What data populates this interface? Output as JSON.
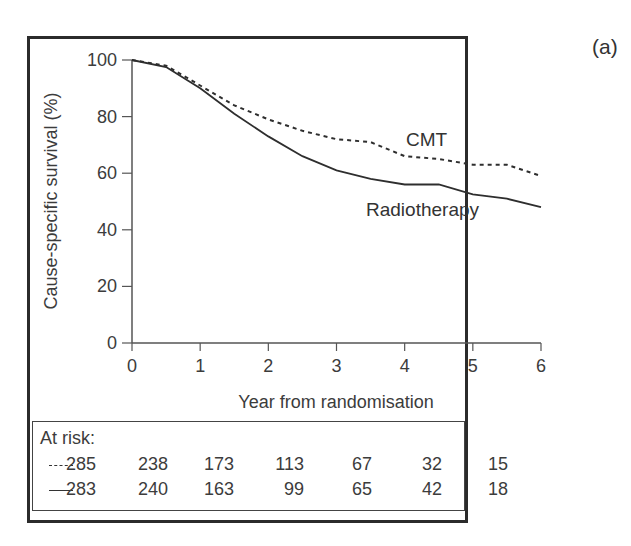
{
  "panel_label": "(a)",
  "chart_data": {
    "type": "line",
    "title": "",
    "xlabel": "Year from randomisation",
    "ylabel": "Cause-specific survival (%)",
    "xlim": [
      0,
      6
    ],
    "ylim": [
      0,
      100
    ],
    "x_ticks": [
      "0",
      "1",
      "2",
      "3",
      "4",
      "5",
      "6"
    ],
    "y_ticks": [
      "0",
      "20",
      "40",
      "60",
      "80",
      "100"
    ],
    "grid": false,
    "legend": "inline labels",
    "series": [
      {
        "name": "CMT",
        "style": "dashed",
        "x": [
          0,
          0.5,
          1,
          1.5,
          2,
          2.5,
          3,
          3.5,
          4,
          4.5,
          5,
          5.5,
          6
        ],
        "values": [
          100,
          98,
          91,
          84,
          79,
          75,
          72,
          71,
          66,
          65,
          63,
          63,
          59
        ]
      },
      {
        "name": "Radiotherapy",
        "style": "solid",
        "x": [
          0,
          0.5,
          1,
          1.5,
          2,
          2.5,
          3,
          3.5,
          4,
          4.5,
          5,
          5.5,
          6
        ],
        "values": [
          100,
          97.5,
          90,
          81,
          73,
          66,
          61,
          58,
          56,
          56,
          52.5,
          51,
          48
        ]
      }
    ],
    "at_risk": {
      "title": "At risk:",
      "rows": [
        {
          "series": "CMT",
          "style": "dashed",
          "values": [
            "285",
            "238",
            "173",
            "113",
            "67",
            "32",
            "15"
          ]
        },
        {
          "series": "Radiotherapy",
          "style": "solid",
          "values": [
            "283",
            "240",
            "163",
            "99",
            "65",
            "42",
            "18"
          ]
        }
      ]
    }
  },
  "colors": {
    "line": "#2e2e2e",
    "axis": "#555555",
    "frame": "#2b2b2b"
  }
}
